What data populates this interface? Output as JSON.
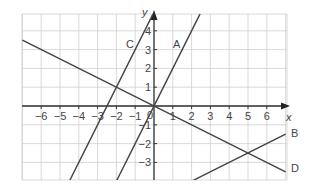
{
  "chart_data": {
    "type": "line",
    "title": "",
    "xlabel": "x",
    "ylabel": "y",
    "xlim": [
      -7,
      7
    ],
    "ylim": [
      -4,
      5
    ],
    "grid": true,
    "x_ticks": [
      "−6",
      "−5",
      "−4",
      "−3",
      "−2",
      "−1",
      "1",
      "2",
      "3",
      "4",
      "5",
      "6"
    ],
    "y_ticks": [
      "4",
      "3",
      "2",
      "1",
      "−1",
      "−2",
      "−3"
    ],
    "origin_label": "0",
    "series": [
      {
        "name": "A",
        "equation": "y = 2x",
        "points": [
          [
            -2,
            -4
          ],
          [
            2.45,
            4.9
          ]
        ]
      },
      {
        "name": "B",
        "equation": "y = 0.5x − 5",
        "points": [
          [
            2,
            -4
          ],
          [
            7,
            -1.5
          ]
        ]
      },
      {
        "name": "C",
        "equation": "y = 2x + 5",
        "points": [
          [
            -4.5,
            -4
          ],
          [
            -0.05,
            4.9
          ]
        ]
      },
      {
        "name": "D",
        "equation": "y = −0.5x",
        "points": [
          [
            -7,
            3.5
          ],
          [
            7,
            -3.5
          ]
        ]
      }
    ]
  },
  "labels": {
    "A": "A",
    "B": "B",
    "C": "C",
    "D": "D",
    "x": "x",
    "y": "y"
  }
}
